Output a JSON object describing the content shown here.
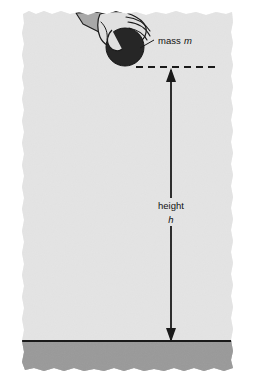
{
  "figure": {
    "caption_labels": {
      "mass_label": "mass",
      "mass_symbol": "m",
      "height_label": "height",
      "height_symbol": "h"
    },
    "colors": {
      "paper_background": "#ffffff",
      "panel_fill": "#e7e7e7",
      "panel_shade": "#dedede",
      "ground_fill": "#9c9c9c",
      "ground_line": "#1a1a1a",
      "ball_fill": "#262626",
      "hand_fill": "#e0e0e0",
      "hand_outline": "#1a1a1a",
      "sleeve_fill": "#a8a8a8",
      "arrow_stroke": "#1a1a1a",
      "dashed_stroke": "#1a1a1a",
      "text_color": "#111111"
    },
    "elements": {
      "ball": {
        "name": "mass-ball",
        "cx": 125,
        "cy": 47,
        "r": 19
      },
      "dashed_line": {
        "y": 67,
        "x_start": 136,
        "x_end": 217
      },
      "height_arrow": {
        "x": 171,
        "y_top": 70,
        "y_bottom": 341
      },
      "ground_line": {
        "y": 341,
        "x_start": 22,
        "x_end": 233
      },
      "leader_line": {
        "x1": 140,
        "y1": 48,
        "x2": 154,
        "y2": 40
      }
    }
  }
}
